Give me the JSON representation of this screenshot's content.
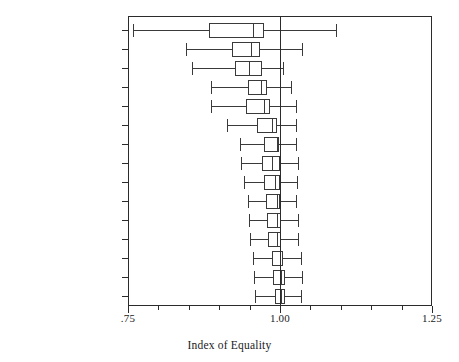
{
  "chart_data": {
    "type": "box",
    "title": "",
    "xlabel": "Index of Equality",
    "ylabel": "",
    "xlim": [
      0.75,
      1.25
    ],
    "grid": false,
    "legend": null,
    "reference_line": 1.0,
    "xticks": [
      0.75,
      1.0,
      1.25
    ],
    "xticklabels": [
      ".75",
      "1.00",
      "1.25"
    ],
    "xminorticks": [
      0.8,
      0.85,
      0.9,
      0.95,
      1.05,
      1.1,
      1.15,
      1.2
    ],
    "categories": [
      "Political Knowledge",
      "Education",
      "Party Identification",
      "Occupation",
      "Income",
      "Race",
      "Gender",
      "Region",
      "Marital Status",
      "Home Ownership",
      "Age",
      "Locality",
      "Financial Status",
      "Union Affiliation",
      "Parental Status"
    ],
    "boxes": [
      {
        "category": "Political Knowledge",
        "whisker_low": 0.758,
        "q1": 0.883,
        "median": 0.955,
        "q3": 0.974,
        "whisker_high": 1.092
      },
      {
        "category": "Education",
        "whisker_low": 0.845,
        "q1": 0.921,
        "median": 0.952,
        "q3": 0.967,
        "whisker_high": 1.036
      },
      {
        "category": "Party Identification",
        "whisker_low": 0.855,
        "q1": 0.926,
        "median": 0.949,
        "q3": 0.97,
        "whisker_high": 1.005
      },
      {
        "category": "Occupation",
        "whisker_low": 0.887,
        "q1": 0.947,
        "median": 0.969,
        "q3": 0.979,
        "whisker_high": 1.018
      },
      {
        "category": "Income",
        "whisker_low": 0.887,
        "q1": 0.944,
        "median": 0.974,
        "q3": 0.983,
        "whisker_high": 1.026
      },
      {
        "category": "Race",
        "whisker_low": 0.913,
        "q1": 0.962,
        "median": 0.987,
        "q3": 0.995,
        "whisker_high": 1.026
      },
      {
        "category": "Gender",
        "whisker_low": 0.934,
        "q1": 0.974,
        "median": 0.995,
        "q3": 0.999,
        "whisker_high": 1.026
      },
      {
        "category": "Region",
        "whisker_low": 0.936,
        "q1": 0.97,
        "median": 0.987,
        "q3": 1.0,
        "whisker_high": 1.03
      },
      {
        "category": "Marital Status",
        "whisker_low": 0.941,
        "q1": 0.974,
        "median": 0.992,
        "q3": 1.0,
        "whisker_high": 1.028
      },
      {
        "category": "Home Ownership",
        "whisker_low": 0.947,
        "q1": 0.977,
        "median": 0.995,
        "q3": 1.0,
        "whisker_high": 1.026
      },
      {
        "category": "Age",
        "whisker_low": 0.949,
        "q1": 0.979,
        "median": 0.995,
        "q3": 1.002,
        "whisker_high": 1.03
      },
      {
        "category": "Locality",
        "whisker_low": 0.951,
        "q1": 0.981,
        "median": 0.995,
        "q3": 1.002,
        "whisker_high": 1.03
      },
      {
        "category": "Financial Status",
        "whisker_low": 0.955,
        "q1": 0.987,
        "median": 1.0,
        "q3": 1.005,
        "whisker_high": 1.034
      },
      {
        "category": "Union Affiliation",
        "whisker_low": 0.957,
        "q1": 0.989,
        "median": 1.002,
        "q3": 1.008,
        "whisker_high": 1.036
      },
      {
        "category": "Parental Status",
        "whisker_low": 0.959,
        "q1": 0.992,
        "median": 1.002,
        "q3": 1.008,
        "whisker_high": 1.034
      }
    ]
  }
}
